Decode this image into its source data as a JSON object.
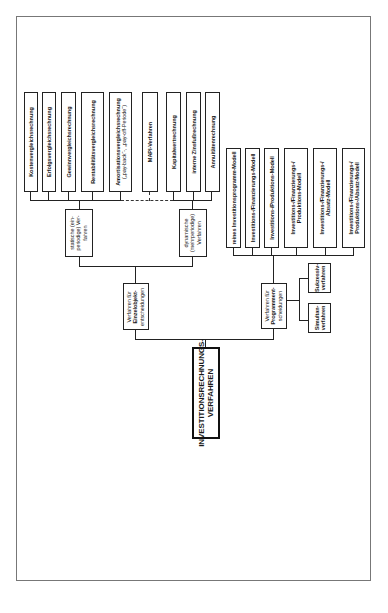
{
  "diagram": {
    "orientation": "rotated-90-ccw",
    "root": {
      "label_line1": "INVESTITIONSRECHNUNGS-",
      "label_line2": "VERFAHREN"
    },
    "branch_single": {
      "label_line1": "Verfahren für",
      "label_line2": "Einzelobjekt-",
      "label_line3": "entscheidungen"
    },
    "branch_program": {
      "label_line1": "Verfahren für",
      "label_line2": "Programment-",
      "label_line3": "scheidungen"
    },
    "static": {
      "label_line1": "statische (ein-",
      "label_line2": "periodige) Ver-",
      "label_line3": "fahren"
    },
    "dynamic": {
      "label_line1": "dynamische",
      "label_line2": "(mehrperiodige)",
      "label_line3": "Verfahren"
    },
    "static_methods": [
      {
        "label": "Kostenvergleichsrechnung"
      },
      {
        "label": "Erfolgsvergleichsrechnung"
      },
      {
        "label": "Gewinnvergleichsrechnung"
      },
      {
        "label": "Rentabilitätsvergleichsrechnung"
      },
      {
        "label_line1": "Amortisationsvergleichsrechnung",
        "label_line2": "(„pay-back“-, „pay-off-Periode“)"
      }
    ],
    "mapi": {
      "label": "MAPI-Verfahren"
    },
    "dynamic_methods": [
      {
        "label": "Kapitalwertrechnung"
      },
      {
        "label": "interne Zinsfußrechnung"
      },
      {
        "label": "Annuitätenrechnung"
      }
    ],
    "program_models": [
      {
        "label": "reines Investitionsprogramm-Modell"
      },
      {
        "label": "Investitions-/Finanzierungs-Modell"
      },
      {
        "label": "Investitions-/Produktions-Modell"
      },
      {
        "label_line1": "Investitions-/Finanzierungs-/",
        "label_line2": "Produktions-Modell"
      },
      {
        "label_line1": "Investitions-/Finanzierungs-/",
        "label_line2": "Absatz-Modell"
      },
      {
        "label_line1": "Investitions-/Finanzierungs-/",
        "label_line2": "Produktions-/Absatz-Modell"
      }
    ],
    "program_approaches": [
      {
        "label_line1": "Sukzessiv-",
        "label_line2": "verfahren"
      },
      {
        "label_line1": "Simultan-",
        "label_line2": "verfahren"
      }
    ]
  }
}
